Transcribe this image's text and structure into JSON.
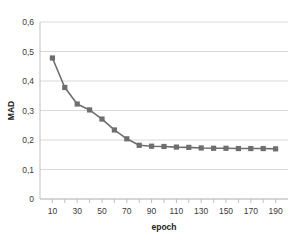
{
  "chart_data": {
    "type": "line",
    "title": "",
    "xlabel": "epoch",
    "ylabel": "MAD",
    "x": [
      10,
      20,
      30,
      40,
      50,
      60,
      70,
      80,
      90,
      100,
      110,
      120,
      130,
      140,
      150,
      160,
      170,
      180,
      190
    ],
    "values": [
      0.478,
      0.378,
      0.322,
      0.302,
      0.271,
      0.234,
      0.204,
      0.182,
      0.179,
      0.178,
      0.176,
      0.175,
      0.173,
      0.172,
      0.172,
      0.171,
      0.171,
      0.171,
      0.17
    ],
    "series": [
      {
        "name": "MAD",
        "values": [
          0.478,
          0.378,
          0.322,
          0.302,
          0.271,
          0.234,
          0.204,
          0.182,
          0.179,
          0.178,
          0.176,
          0.175,
          0.173,
          0.172,
          0.172,
          0.171,
          0.171,
          0.171,
          0.17
        ]
      }
    ],
    "xlim": [
      0,
      200
    ],
    "ylim": [
      0,
      0.6
    ],
    "x_tick_values": [
      10,
      30,
      50,
      70,
      90,
      110,
      130,
      150,
      170,
      190
    ],
    "x_tick_labels": [
      "10",
      "30",
      "50",
      "70",
      "90",
      "110",
      "130",
      "150",
      "170",
      "190"
    ],
    "x_minor_tick_values": [
      10,
      20,
      30,
      40,
      50,
      60,
      70,
      80,
      90,
      100,
      110,
      120,
      130,
      140,
      150,
      160,
      170,
      180,
      190
    ],
    "y_tick_values": [
      0,
      0.1,
      0.2,
      0.3,
      0.4,
      0.5,
      0.6
    ],
    "y_tick_labels": [
      "0",
      "0,1",
      "0,2",
      "0,3",
      "0,4",
      "0,5",
      "0,6"
    ],
    "grid": {
      "horizontal": true,
      "vertical": false
    },
    "legend": {
      "visible": false,
      "position": "none"
    },
    "marker": "square",
    "colors": {
      "series": "#6e6e6e",
      "line": "#6e6e6e",
      "grid": "#d9d9d9",
      "axis": "#bfbfbf",
      "tick_text": "#3a3a3a",
      "title_text": "#1d1d1d",
      "background": "#ffffff"
    }
  }
}
